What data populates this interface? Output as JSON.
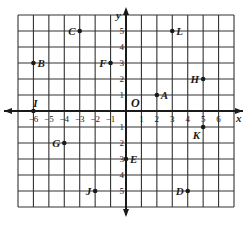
{
  "diagram": {
    "type": "coordinate-grid",
    "x_axis_label": "x",
    "y_axis_label": "y",
    "origin_label": "O",
    "x_range": [
      -7,
      7
    ],
    "y_range": [
      -6,
      6
    ],
    "x_ticks": [
      -6,
      -5,
      -4,
      -3,
      -2,
      -1,
      1,
      2,
      3,
      4,
      5,
      6
    ],
    "y_ticks": [
      5,
      4,
      3,
      2,
      1,
      -1,
      -2,
      -3,
      -4,
      -5
    ],
    "points": [
      {
        "label": "A",
        "x": 2,
        "y": 1,
        "label_side": "right"
      },
      {
        "label": "B",
        "x": -6,
        "y": 3,
        "label_side": "right"
      },
      {
        "label": "C",
        "x": -3,
        "y": 5,
        "label_side": "left"
      },
      {
        "label": "D",
        "x": 4,
        "y": -5,
        "label_side": "left"
      },
      {
        "label": "E",
        "x": 0,
        "y": -3,
        "label_side": "right"
      },
      {
        "label": "F",
        "x": -1,
        "y": 3,
        "label_side": "left"
      },
      {
        "label": "G",
        "x": -4,
        "y": -2,
        "label_side": "left"
      },
      {
        "label": "H",
        "x": 5,
        "y": 2,
        "label_side": "left"
      },
      {
        "label": "I",
        "x": -6,
        "y": 0,
        "label_side": "above"
      },
      {
        "label": "J",
        "x": -2,
        "y": -5,
        "label_side": "left"
      },
      {
        "label": "K",
        "x": 5,
        "y": -1,
        "label_side": "below-left"
      },
      {
        "label": "L",
        "x": 3,
        "y": 5,
        "label_side": "right"
      }
    ],
    "colors": {
      "grid": "#333333",
      "ink": "#1a1a1a",
      "background": "#ffffff"
    }
  }
}
